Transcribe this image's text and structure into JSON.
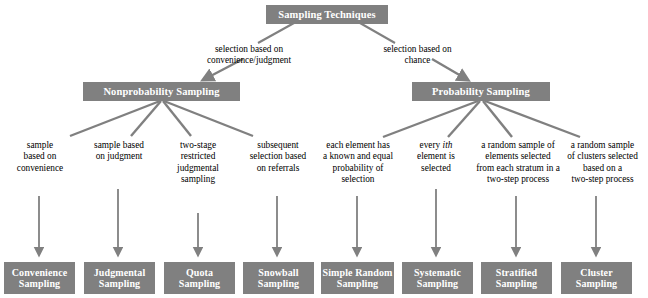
{
  "diagram": {
    "title_node": {
      "label": "Sampling Techniques"
    },
    "branch_labels": {
      "nonprobability": "selection based on\nconvenience/judgment",
      "probability": "selection based on\nchance"
    },
    "level2": [
      {
        "label": "Nonprobability Sampling"
      },
      {
        "label": "Probability Sampling"
      }
    ],
    "descriptions": [
      {
        "text": "sample\nbased on\nconvenience"
      },
      {
        "text": "sample based\non judgment"
      },
      {
        "text": "two-stage\nrestricted\njudgmental\nsampling"
      },
      {
        "text": "subsequent\nselection based\non referrals"
      },
      {
        "text": "each element has\na known and equal\nprobability of\nselection"
      },
      {
        "text_before": "every ",
        "text_italic": "i",
        "text_italic2": "th",
        "text_after": "\nelement is\nselected"
      },
      {
        "text": "a random sample of\nelements selected\nfrom each stratum in a\ntwo-step process"
      },
      {
        "text": "a random sample\nof clusters selected\nbased on a\ntwo-step process"
      }
    ],
    "leaves": [
      {
        "label": "Convenience\nSampling"
      },
      {
        "label": "Judgmental\nSampling"
      },
      {
        "label": "Quota\nSampling"
      },
      {
        "label": "Snowball\nSampling"
      },
      {
        "label": "Simple Random\nSampling"
      },
      {
        "label": "Systematic\nSampling"
      },
      {
        "label": "Stratified\nSampling"
      },
      {
        "label": "Cluster\nSampling"
      }
    ],
    "colors": {
      "box_fill": "#808080",
      "box_text": "#ffffff",
      "connector": "#808080",
      "background": "#ffffff",
      "label_text": "#000000"
    }
  }
}
